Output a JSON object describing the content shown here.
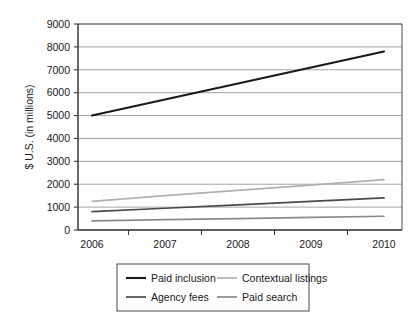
{
  "chart_data": {
    "type": "line",
    "title": "",
    "xlabel": "",
    "ylabel": "$ U.S. (in millions)",
    "categories": [
      "2006",
      "2007",
      "2008",
      "2009",
      "2010"
    ],
    "x": [
      2006,
      2007,
      2008,
      2009,
      2010
    ],
    "ylim": [
      0,
      9000
    ],
    "ytick_labels": [
      "0",
      "1000",
      "2000",
      "3000",
      "4000",
      "5000",
      "6000",
      "7000",
      "8000",
      "9000"
    ],
    "yticks": [
      0,
      1000,
      2000,
      3000,
      4000,
      5000,
      6000,
      7000,
      8000,
      9000
    ],
    "grid": "horizontal",
    "legend_position": "bottom",
    "series": [
      {
        "name": "Paid inclusion",
        "color": "#1a1a1a",
        "values": [
          5000,
          5700,
          6400,
          7100,
          7800
        ]
      },
      {
        "name": "Contextual listings",
        "color": "#b0b0b0",
        "values": [
          1250,
          1500,
          1730,
          1960,
          2200
        ]
      },
      {
        "name": "Agency fees",
        "color": "#4a4a4a",
        "values": [
          800,
          950,
          1100,
          1250,
          1400
        ]
      },
      {
        "name": "Paid search",
        "color": "#8a8a8a",
        "values": [
          400,
          450,
          500,
          550,
          600
        ]
      }
    ]
  },
  "legend": {
    "entries": [
      {
        "label": "Paid inclusion",
        "color": "#1a1a1a"
      },
      {
        "label": "Contextual listings",
        "color": "#b0b0b0"
      },
      {
        "label": "Agency fees",
        "color": "#4a4a4a"
      },
      {
        "label": "Paid search",
        "color": "#8a8a8a"
      }
    ]
  },
  "colors": {
    "background": "#ffffff",
    "axis": "#3a3a3a",
    "gridline": "#9a9a9a",
    "text": "#1a1a1a",
    "plot_border": "#5a5a5a"
  }
}
